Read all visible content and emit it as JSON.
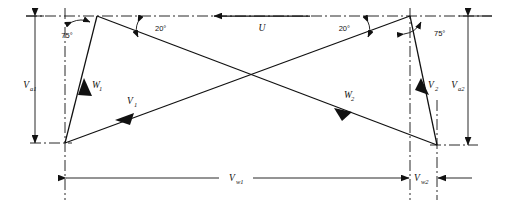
{
  "figure": {
    "type": "velocity-triangle-diagram",
    "background_color": "#ffffff",
    "line_color": "#111111",
    "width": 506,
    "height": 216
  },
  "vectors": [
    {
      "id": "U",
      "label": "U",
      "sub": "",
      "direction": "left",
      "description": "blade-speed vector along top centerline"
    },
    {
      "id": "W1",
      "label": "W",
      "sub": "1",
      "direction": "down-left",
      "description": "relative velocity at inlet"
    },
    {
      "id": "V1",
      "label": "V",
      "sub": "1",
      "direction": "down-left",
      "description": "absolute velocity at inlet"
    },
    {
      "id": "W2",
      "label": "W",
      "sub": "2",
      "direction": "down-left",
      "description": "relative velocity at outlet"
    },
    {
      "id": "V2",
      "label": "V",
      "sub": "2",
      "direction": "down-right",
      "description": "absolute velocity at outlet"
    }
  ],
  "angles": [
    {
      "id": "a-left-75",
      "value": "75",
      "unit": "°",
      "text": "75°",
      "position": "left-apex"
    },
    {
      "id": "a-left-20",
      "value": "20",
      "unit": "°",
      "text": "20°",
      "position": "left-diagonal"
    },
    {
      "id": "a-right-20",
      "value": "20",
      "unit": "°",
      "text": "20°",
      "position": "right-diagonal"
    },
    {
      "id": "a-right-75",
      "value": "75",
      "unit": "°",
      "text": "75°",
      "position": "right-apex"
    }
  ],
  "dimensions": [
    {
      "id": "Va1",
      "label": "V",
      "sub": "a1",
      "orientation": "vertical",
      "side": "left",
      "description": "axial velocity at inlet"
    },
    {
      "id": "Va2",
      "label": "V",
      "sub": "a2",
      "orientation": "vertical",
      "side": "right",
      "description": "axial velocity at outlet"
    },
    {
      "id": "Vw1",
      "label": "V",
      "sub": "w1",
      "orientation": "horizontal",
      "side": "span",
      "description": "whirl velocity at inlet"
    },
    {
      "id": "Vw2",
      "label": "V",
      "sub": "w2",
      "orientation": "horizontal",
      "side": "right",
      "description": "whirl velocity at outlet"
    }
  ]
}
